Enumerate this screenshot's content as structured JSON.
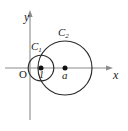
{
  "figure": {
    "background_color": "#ffffff",
    "axis_color": "#8c8c8c",
    "curve_color": "#2b2b2b",
    "dot_color": "#111111"
  },
  "axes": {
    "y_axis": {
      "label": "y",
      "x_position": 30,
      "top": 12,
      "bottom": 120
    },
    "x_axis": {
      "label": "x",
      "y_position": 68,
      "left": 5,
      "right": 112
    },
    "origin": {
      "label": "O",
      "x": 30,
      "y": 68
    }
  },
  "circles": [
    {
      "name": "C1",
      "label": "C",
      "subscript": "1",
      "center_x": 41,
      "center_y": 68,
      "radius": 12.8,
      "center_label": "1"
    },
    {
      "name": "C2",
      "label": "C",
      "subscript": "2",
      "center_x": 65,
      "center_y": 68,
      "radius": 27,
      "center_label": "a"
    }
  ],
  "points": [
    {
      "name": "center-c1",
      "label": "1",
      "x": 41,
      "y": 68
    },
    {
      "name": "center-c2",
      "label": "a",
      "x": 65,
      "y": 68
    }
  ]
}
